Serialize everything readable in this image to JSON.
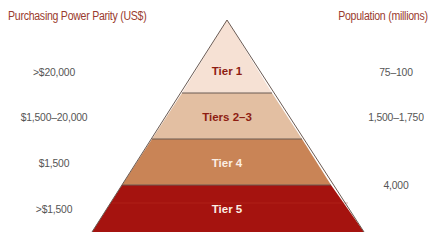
{
  "headers": {
    "left": "Purchasing Power Parity (US$)",
    "right": "Population (millions)"
  },
  "tiers": [
    {
      "label": "Tier 1",
      "ppp": ">$20,000",
      "population": "75–100",
      "fill": "#f6e1d4",
      "text_color": "#8e1d12"
    },
    {
      "label": "Tiers 2–3",
      "ppp": "$1,500–20,000",
      "population": "1,500–1,750",
      "fill": "#e3bfa2",
      "text_color": "#8e1d12"
    },
    {
      "label": "Tier 4",
      "ppp": "$1,500",
      "population": "4,000",
      "fill": "#c98456",
      "text_color": "#fbeee4"
    },
    {
      "label": "Tier 5",
      "ppp": ">$1,500",
      "population": "",
      "fill": "#a5130f",
      "text_color": "#fbeee4"
    }
  ],
  "colors": {
    "header": "#9a3b2e",
    "label": "#555555",
    "outline": "#6b5a52"
  }
}
